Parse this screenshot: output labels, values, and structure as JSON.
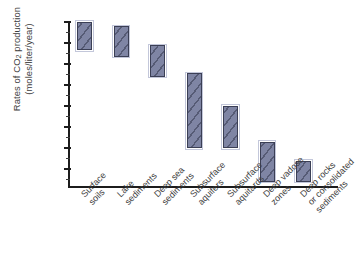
{
  "chart_data": {
    "type": "bar",
    "title": "",
    "subtitle": "",
    "xlabel": "",
    "ylabel_line1": "Rates of CO",
    "ylabel_sub": "2",
    "ylabel_line1_tail": " production",
    "ylabel_line2": "(moles/liter/year)",
    "ylabel": "Rates of CO2 production (moles/liter/year)",
    "y_scale": "log",
    "ylim": [
      1e-14,
      10
    ],
    "y_tick_labels": [
      "10",
      "10",
      "10",
      "10",
      "10",
      "10",
      "10",
      "10"
    ],
    "y_tick_exponents": [
      "1",
      "-1",
      "-3",
      "-5",
      "-7",
      "-9",
      "-11",
      "-13"
    ],
    "y_tick_values": [
      10,
      0.1,
      0.001,
      1e-05,
      1e-07,
      1e-09,
      1e-11,
      1e-13
    ],
    "grid": false,
    "legend": "none",
    "categories": [
      "Surface soils",
      "Lake sediments",
      "Deep sea sediments",
      "Subsurface aquifers",
      "Subsurface aquitards",
      "Deep vadose zones",
      "Deep rocks or consolidated sediments"
    ],
    "category_lines": [
      [
        "Surface",
        "soils"
      ],
      [
        "Lake",
        "sediments"
      ],
      [
        "Deep sea",
        "sediments"
      ],
      [
        "Subsurface",
        "aquifers"
      ],
      [
        "Subsurface",
        "aquitards"
      ],
      [
        "Deep vadose",
        "zones"
      ],
      [
        "Deep rocks",
        "or consolidated",
        "sediments"
      ]
    ],
    "series": [
      {
        "name": "Rate range",
        "kind": "range-box",
        "ranges": [
          {
            "category": "Surface soils",
            "low_exp": -1.7,
            "high_exp": 1.0,
            "low": 0.02,
            "high": 10.0
          },
          {
            "category": "Lake sediments",
            "low_exp": -2.3,
            "high_exp": 0.6,
            "low": 0.005,
            "high": 4.0
          },
          {
            "category": "Deep sea sediments",
            "low_exp": -4.2,
            "high_exp": -1.2,
            "low": 6e-05,
            "high": 0.06
          },
          {
            "category": "Subsurface aquifers",
            "low_exp": -11.0,
            "high_exp": -3.9,
            "low": 1e-11,
            "high": 0.00012
          },
          {
            "category": "Subsurface aquitards",
            "low_exp": -11.0,
            "high_exp": -7.0,
            "low": 1e-11,
            "high": 1e-07
          },
          {
            "category": "Deep vadose zones",
            "low_exp": -14.2,
            "high_exp": -10.4,
            "low": 6e-15,
            "high": 4e-11
          },
          {
            "category": "Deep rocks or consolidated sediments",
            "low_exp": -14.2,
            "high_exp": -12.2,
            "low": 6e-15,
            "high": 6e-13
          }
        ]
      }
    ],
    "colors": {
      "bar_fill": "#7f85a4",
      "bar_hatch": "#34384e",
      "bar_border": "#3b3f55",
      "axis": "#1c1c1c",
      "text": "#3d3d3d",
      "background": "#ffffff"
    }
  }
}
